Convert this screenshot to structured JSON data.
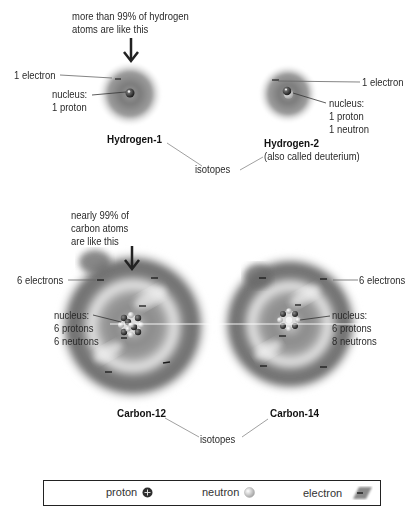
{
  "hydrogen": {
    "callout": [
      "more than 99% of hydrogen",
      "atoms are like this"
    ],
    "h1": {
      "title": "Hydrogen-1",
      "electron_label": "1 electron",
      "nucleus_label": [
        "nucleus:",
        "1 proton"
      ]
    },
    "h2": {
      "title": "Hydrogen-2",
      "subtitle": "(also called deuterium)",
      "electron_label": "1 electron",
      "nucleus_label": [
        "nucleus:",
        "1 proton",
        "1 neutron"
      ]
    },
    "isotopes_label": "isotopes"
  },
  "carbon": {
    "callout": [
      "nearly 99% of",
      "carbon atoms",
      "are like this"
    ],
    "c12": {
      "title": "Carbon-12",
      "electron_label": "6 electrons",
      "nucleus_label": [
        "nucleus:",
        "6 protons",
        "6 neutrons"
      ]
    },
    "c14": {
      "title": "Carbon-14",
      "electron_label": "6 electrons",
      "nucleus_label": [
        "nucleus:",
        "6 protons",
        "8 neutrons"
      ]
    },
    "isotopes_label": "isotopes"
  },
  "legend": {
    "proton": "proton",
    "neutron": "neutron",
    "electron": "electron"
  },
  "colors": {
    "cloud": "#6e6e6e",
    "proton": "#3a3a3a",
    "neutron": "#c8c8c8",
    "leader_line": "#555555",
    "text": "#2a2a2a"
  }
}
